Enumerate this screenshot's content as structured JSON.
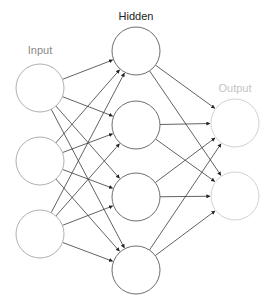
{
  "diagram": {
    "layers": [
      {
        "name": "Input",
        "label_color": "#8a8a8a",
        "node_color": "#b0b0b0",
        "label_pos": [
          40,
          54
        ],
        "nodes": [
          [
            40,
            88
          ],
          [
            40,
            161
          ],
          [
            40,
            234
          ]
        ]
      },
      {
        "name": "Hidden",
        "label_color": "#222222",
        "node_color": "#6e6e6e",
        "label_pos": [
          136,
          20
        ],
        "nodes": [
          [
            136,
            51
          ],
          [
            136,
            125
          ],
          [
            136,
            197
          ],
          [
            136,
            270
          ]
        ]
      },
      {
        "name": "Output",
        "label_color": "#c4c4c4",
        "node_color": "#d2d2d2",
        "label_pos": [
          235,
          92
        ],
        "nodes": [
          [
            235,
            123
          ],
          [
            235,
            196
          ]
        ]
      }
    ],
    "node_radius": 24,
    "edge_color": "#3a3a3a",
    "connections": "fully-connected input→hidden, hidden→output"
  }
}
